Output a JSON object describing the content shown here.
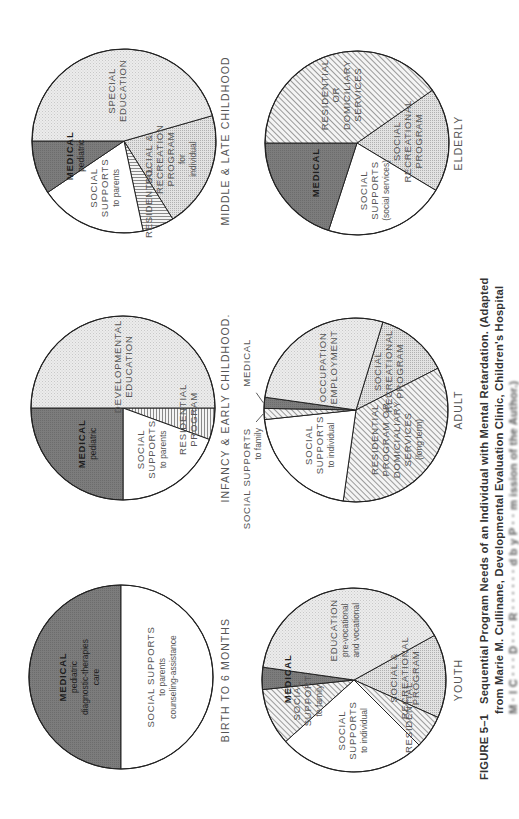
{
  "page": {
    "orientation": "rotated-90-ccw"
  },
  "caption": {
    "label": "FIGURE 5–1",
    "line1": "Sequential Program Needs of an Individual with Mental Retardation. (Adapted",
    "line2": "from  Marie M. Cullinane, Developmental Evaluation Clinic, Children's Hospital",
    "line3": "M  ·  l  C  ·  ·  ·  D  ·  ·  ·    R  ·  ·  ·  ·  ·  ·  d  b y  P  ·  · m ission of the Author.)"
  },
  "colors": {
    "outline": "#222222",
    "dark": "#7c7c7c",
    "light_dots": "#e6e6e6",
    "medium_dots": "#d4d4d4",
    "white": "#ffffff",
    "hatch": "#bdbdbd"
  },
  "chart_data": [
    {
      "type": "pie",
      "title": "BIRTH TO 6 MONTHS",
      "center": [
        121,
        677
      ],
      "radius": 92,
      "title_pos": [
        229,
        680
      ],
      "slices": [
        {
          "label": "MEDICAL",
          "sub": [
            "pediatric",
            "diagnostic-therapies",
            "care"
          ],
          "start": 90,
          "end": 270,
          "fill": "dark",
          "share_deg": 180
        },
        {
          "label": "SOCIAL SUPPORTS",
          "sub": [
            "to parents",
            "counseling-assistance"
          ],
          "start": 270,
          "end": 450,
          "fill": "white",
          "share_deg": 180
        }
      ]
    },
    {
      "type": "pie",
      "title": "INFANCY & EARLY CHILDHOOD.",
      "center": [
        123,
        408
      ],
      "radius": 92,
      "title_pos": [
        229,
        408
      ],
      "slices": [
        {
          "label": "RESIDENTIAL",
          "sub": [
            "PROGRAM"
          ],
          "start": 0,
          "end": 20,
          "fill": "hatch_v",
          "share_deg": 20
        },
        {
          "label": "SOCIAL",
          "sub": [
            "SUPPORTS",
            "to parents"
          ],
          "start": 20,
          "end": 90,
          "fill": "white",
          "share_deg": 70
        },
        {
          "label": "MEDICAL",
          "sub": [
            "pediatric"
          ],
          "start": 90,
          "end": 180,
          "fill": "dark",
          "share_deg": 90
        },
        {
          "label": "DEVELOPMENTAL",
          "sub": [
            "EDUCATION"
          ],
          "start": 180,
          "end": 360,
          "fill": "light",
          "share_deg": 180
        }
      ]
    },
    {
      "type": "pie",
      "title": "MIDDLE & LATE CHILDHOOD",
      "center": [
        124,
        141
      ],
      "radius": 92,
      "title_pos": [
        229,
        141
      ],
      "slices": [
        {
          "label": "SOCIAL &",
          "sub": [
            "RECREATION",
            "PROGRAM",
            "for",
            "individual"
          ],
          "start": -16,
          "end": 58,
          "fill": "medium",
          "share_deg": 74
        },
        {
          "label": "RESIDENTIAL",
          "sub": [],
          "start": 58,
          "end": 78,
          "fill": "hatch_h",
          "share_deg": 20
        },
        {
          "label": "SOCIAL",
          "sub": [
            "SUPPORTS",
            "to parents"
          ],
          "start": 78,
          "end": 146,
          "fill": "white",
          "share_deg": 68
        },
        {
          "label": "MEDICAL",
          "sub": [
            "pediatric"
          ],
          "start": 146,
          "end": 180,
          "fill": "dark",
          "share_deg": 34
        },
        {
          "label": "SPECIAL",
          "sub": [
            "EDUCATION"
          ],
          "start": 180,
          "end": 344,
          "fill": "light",
          "share_deg": 164
        }
      ]
    },
    {
      "type": "pie",
      "title": "YOUTH",
      "center": [
        354,
        680
      ],
      "radius": 92,
      "title_pos": [
        462,
        680
      ],
      "slices": [
        {
          "label": "SOCIAL &",
          "sub": [
            "RECREATIONAL",
            "PROGRAM"
          ],
          "start": -29,
          "end": 24,
          "fill": "medium",
          "share_deg": 53
        },
        {
          "label": "RESIDENTIAL",
          "sub": [],
          "start": 24,
          "end": 45,
          "fill": "hatch_d",
          "share_deg": 21
        },
        {
          "label": "SOCIAL",
          "sub": [
            "SUPPORTS",
            "to individual"
          ],
          "start": 45,
          "end": 138,
          "fill": "white",
          "share_deg": 93
        },
        {
          "label": "SOCIAL",
          "sub": [
            "SUPPORT",
            "to family"
          ],
          "start": 138,
          "end": 174,
          "fill": "hatch_d",
          "share_deg": 36
        },
        {
          "label": "MEDICAL",
          "sub": [],
          "start": 174,
          "end": 188,
          "fill": "dark",
          "share_deg": 14
        },
        {
          "label": "EDUCATION",
          "sub": [
            "pre-vocational",
            "and vocational"
          ],
          "start": 188,
          "end": 331,
          "fill": "light",
          "share_deg": 143
        }
      ]
    },
    {
      "type": "pie",
      "title": "ADULT",
      "center": [
        356,
        410
      ],
      "radius": 92,
      "title_pos": [
        462,
        410
      ],
      "slices": [
        {
          "label": "SOCIAL",
          "sub": [
            "RECREATIONAL",
            "PROGRAM"
          ],
          "start": -73,
          "end": -27,
          "fill": "medium",
          "share_deg": 46
        },
        {
          "label": "RESIDENTIAL",
          "sub": [
            "PROGRAM OR",
            "DOMICIALIARY",
            "SERVICES",
            "(long term)"
          ],
          "start": -27,
          "end": 98,
          "fill": "hatch_d",
          "share_deg": 125
        },
        {
          "label": "SOCIAL",
          "sub": [
            "SUPPORTS",
            "to individual"
          ],
          "start": 98,
          "end": 174,
          "fill": "white",
          "share_deg": 76
        },
        {
          "label": "SOCIAL SUPPORTS",
          "sub": [
            "to family"
          ],
          "start": 174,
          "end": 181,
          "fill": "hatch_d",
          "share_deg": 7,
          "callout": true
        },
        {
          "label": "MEDICAL",
          "sub": [],
          "start": 181,
          "end": 188,
          "fill": "dark",
          "share_deg": 7,
          "callout": true
        },
        {
          "label": "OCCUPATION",
          "sub": [
            "EMPLOYMENT"
          ],
          "start": 188,
          "end": 287,
          "fill": "light",
          "share_deg": 99
        }
      ]
    },
    {
      "type": "pie",
      "title": "ELDERLY",
      "center": [
        357,
        143
      ],
      "radius": 92,
      "title_pos": [
        462,
        143
      ],
      "slices": [
        {
          "label": "SOCIAL",
          "sub": [
            "RECREATIONAL",
            "PROGRAM"
          ],
          "start": -35,
          "end": 31,
          "fill": "medium",
          "share_deg": 66
        },
        {
          "label": "SOCIAL",
          "sub": [
            "SUPPORTS",
            "(social services)"
          ],
          "start": 31,
          "end": 108,
          "fill": "white",
          "share_deg": 77
        },
        {
          "label": "MEDICAL",
          "sub": [],
          "start": 108,
          "end": 180,
          "fill": "dark",
          "share_deg": 72
        },
        {
          "label": "RESIDENTIAL",
          "sub": [
            "OR",
            "DOMICILIARY",
            "SERVICES"
          ],
          "start": 180,
          "end": 325,
          "fill": "hatch_d",
          "share_deg": 145
        }
      ]
    }
  ]
}
